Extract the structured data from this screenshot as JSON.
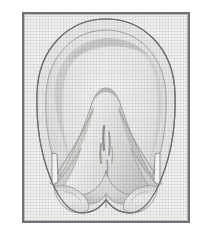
{
  "figure": {
    "title": "Solar surface of the equine hoof",
    "caption": "",
    "view": "solar (ground) surface",
    "style": "grayscale halftone anatomical illustration",
    "orientation": "toe at top, heels at bottom"
  },
  "frame": {
    "outer_border_color": "#6e7176",
    "inner_border_color": "#b9bbbd",
    "panel_background": "#f0f0ef",
    "page_background": "#ffffff",
    "outer_border_width_px": 2,
    "inner_border_width_px": 1,
    "x": 22,
    "y": 12,
    "width": 168,
    "height": 211
  },
  "palette": {
    "outline": "#8a8c8e",
    "outline_dark": "#6f7173",
    "wall_fill": "#e6e5e3",
    "sole_fill": "#eceae8",
    "sole_shadow": "#d3d2d0",
    "frog_fill": "#e2e1df",
    "frog_shadow": "#c6c5c3",
    "groove_line": "#a9a8a6",
    "sulcus_mark": "#8e8d8b",
    "bulb_fill": "#e4e3e1",
    "highlight": "#f7f6f5"
  },
  "anatomy": {
    "parts": [
      {
        "id": "hoof-wall",
        "label": "Hoof wall",
        "description": "Outer keratinized border forming the rounded toe and straighter quarters"
      },
      {
        "id": "white-line",
        "label": "White line",
        "description": "Narrow junction arc between wall and sole"
      },
      {
        "id": "sole",
        "label": "Sole",
        "description": "Concave plate filling the space between wall and frog"
      },
      {
        "id": "frog",
        "label": "Frog",
        "description": "Central V-shaped wedge with apex pointing toward the toe"
      },
      {
        "id": "central-sulcus",
        "label": "Central sulcus",
        "description": "Vertical cleft markings in the middle of the frog"
      },
      {
        "id": "collateral-groove-left",
        "label": "Collateral groove (left)",
        "description": "Diagonal furrow between frog and bar"
      },
      {
        "id": "collateral-groove-right",
        "label": "Collateral groove (right)",
        "description": "Diagonal furrow between frog and bar"
      },
      {
        "id": "bar-left",
        "label": "Bar (left)",
        "description": "Inward-turned wall extension ending in a notch"
      },
      {
        "id": "bar-right",
        "label": "Bar (right)",
        "description": "Inward-turned wall extension ending in a notch"
      },
      {
        "id": "heel-bulb-left",
        "label": "Heel bulb (left)",
        "description": "Rounded soft bulb at the palmar border"
      },
      {
        "id": "heel-bulb-right",
        "label": "Heel bulb (right)",
        "description": "Rounded soft bulb at the palmar border"
      },
      {
        "id": "heel-notch-left",
        "label": "Heel notch (left)",
        "description": "Angular cut-out where bar meets heel"
      },
      {
        "id": "heel-notch-right",
        "label": "Heel notch (right)",
        "description": "Angular cut-out where bar meets heel"
      }
    ]
  },
  "labels": {
    "annotations": [],
    "leader_lines": []
  }
}
